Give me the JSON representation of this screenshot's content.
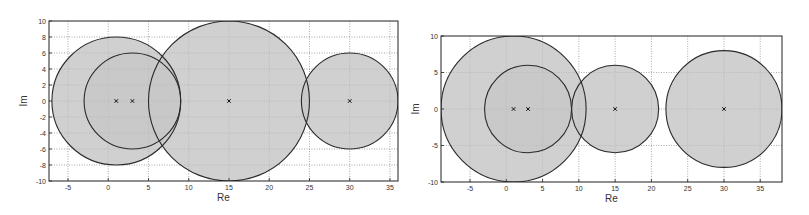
{
  "chart_data": [
    {
      "type": "scatter",
      "title": "",
      "xlabel": "Re",
      "ylabel": "Im",
      "xlim": [
        -7.36,
        36
      ],
      "ylim": [
        -10,
        10
      ],
      "grid": true,
      "xticks": [
        -5,
        0,
        5,
        10,
        15,
        20,
        25,
        30,
        35
      ],
      "yticks": [
        -10,
        -8,
        -6,
        -4,
        -2,
        0,
        2,
        4,
        6,
        8,
        10
      ],
      "circles": [
        {
          "cx": 1,
          "cy": 0,
          "r": 8
        },
        {
          "cx": 3,
          "cy": 0,
          "r": 6
        },
        {
          "cx": 15,
          "cy": 0,
          "r": 10
        },
        {
          "cx": 30,
          "cy": 0,
          "r": 6
        }
      ],
      "points": [
        {
          "x": 1,
          "y": 0,
          "marker": "x"
        },
        {
          "x": 3,
          "y": 0,
          "marker": "x"
        },
        {
          "x": 15,
          "y": 0,
          "marker": "x"
        },
        {
          "x": 30,
          "y": 0,
          "marker": "x"
        }
      ],
      "box": {
        "left": 49,
        "top": 21,
        "right": 398,
        "bottom": 181
      }
    },
    {
      "type": "scatter",
      "title": "",
      "xlabel": "Re",
      "ylabel": "Im",
      "xlim": [
        -9,
        38
      ],
      "ylim": [
        -10,
        10
      ],
      "grid": true,
      "xticks": [
        -5,
        0,
        5,
        10,
        15,
        20,
        25,
        30,
        35
      ],
      "yticks": [
        -10,
        -5,
        0,
        5,
        10
      ],
      "circles": [
        {
          "cx": 1,
          "cy": 0,
          "r": 10
        },
        {
          "cx": 3,
          "cy": 0,
          "r": 6
        },
        {
          "cx": 15,
          "cy": 0,
          "r": 6
        },
        {
          "cx": 30,
          "cy": 0,
          "r": 8
        }
      ],
      "points": [
        {
          "x": 1,
          "y": 0,
          "marker": "x"
        },
        {
          "x": 3,
          "y": 0,
          "marker": "x"
        },
        {
          "x": 15,
          "y": 0,
          "marker": "x"
        },
        {
          "x": 30,
          "y": 0,
          "marker": "x"
        }
      ],
      "box": {
        "left": 441,
        "top": 36,
        "right": 782,
        "bottom": 182
      }
    }
  ],
  "style": {
    "fill": "#c8c8c8",
    "stroke": "#2a2a2a",
    "grid": "#888888",
    "axis": "#222222"
  }
}
